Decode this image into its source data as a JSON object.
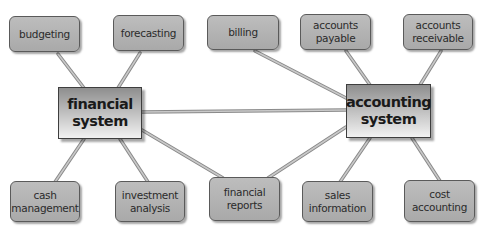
{
  "diagram": {
    "hubs": [
      {
        "id": "financial",
        "label": "financial\nsystem"
      },
      {
        "id": "accounting",
        "label": "accounting\nsystem"
      }
    ],
    "nodes": [
      {
        "id": "budgeting",
        "label": "budgeting"
      },
      {
        "id": "forecasting",
        "label": "forecasting"
      },
      {
        "id": "billing",
        "label": "billing"
      },
      {
        "id": "accounts-payable",
        "label": "accounts\npayable"
      },
      {
        "id": "accounts-receivable",
        "label": "accounts\nreceivable"
      },
      {
        "id": "cash-management",
        "label": "cash\nmanagement"
      },
      {
        "id": "investment-analysis",
        "label": "investment\nanalysis"
      },
      {
        "id": "financial-reports",
        "label": "financial\nreports"
      },
      {
        "id": "sales-information",
        "label": "sales\ninformation"
      },
      {
        "id": "cost-accounting",
        "label": "cost\naccounting"
      }
    ],
    "edges": [
      [
        "financial",
        "budgeting"
      ],
      [
        "financial",
        "forecasting"
      ],
      [
        "financial",
        "accounting"
      ],
      [
        "financial",
        "cash-management"
      ],
      [
        "financial",
        "investment-analysis"
      ],
      [
        "financial",
        "financial-reports"
      ],
      [
        "accounting",
        "billing"
      ],
      [
        "accounting",
        "accounts-payable"
      ],
      [
        "accounting",
        "accounts-receivable"
      ],
      [
        "accounting",
        "financial-reports"
      ],
      [
        "accounting",
        "sales-information"
      ],
      [
        "accounting",
        "cost-accounting"
      ]
    ],
    "colors": {
      "node_fill": "#b3b3b3",
      "node_border": "#5a5a5a",
      "edge": "#a8a8a8",
      "edge_outline": "#888888"
    }
  }
}
